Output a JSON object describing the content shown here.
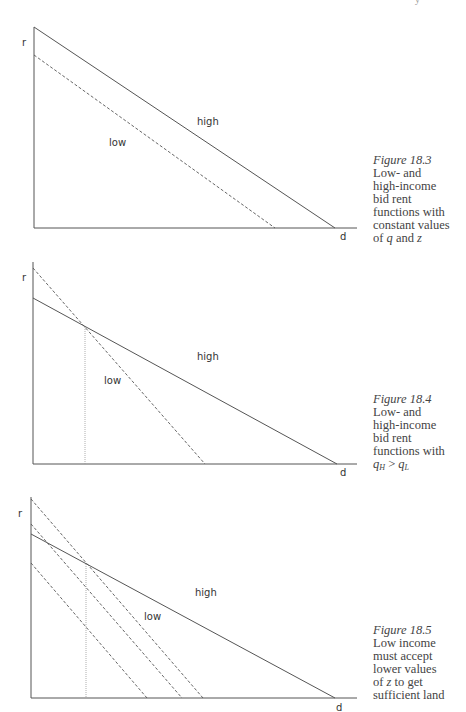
{
  "page": {
    "header_fragment": "y"
  },
  "figures": [
    {
      "id": "fig-18-3",
      "caption": {
        "title": "Figure 18.3",
        "lines": [
          "Low- and",
          "high-income",
          "bid rent",
          "functions with",
          "constant values"
        ],
        "last_line_parts": [
          "of ",
          "q",
          " and ",
          "z"
        ]
      },
      "axis_labels": {
        "y": "r",
        "x": "d"
      },
      "curve_labels": {
        "high": "high",
        "low": "low"
      }
    },
    {
      "id": "fig-18-4",
      "caption": {
        "title": "Figure 18.4",
        "lines": [
          "Low- and",
          "high-income",
          "bid rent",
          "functions with"
        ],
        "condition": {
          "left": "q",
          "left_sub": "H",
          "op": " > ",
          "right": "q",
          "right_sub": "L"
        }
      },
      "axis_labels": {
        "y": "r",
        "x": "d"
      },
      "curve_labels": {
        "high": "high",
        "low": "low"
      }
    },
    {
      "id": "fig-18-5",
      "caption": {
        "title": "Figure 18.5",
        "lines": [
          "Low income",
          "must accept",
          "lower values"
        ],
        "line_z_parts": [
          "of ",
          "z",
          " to get"
        ],
        "last_line": "sufficient land"
      },
      "axis_labels": {
        "y": "r",
        "x": "d"
      },
      "curve_labels": {
        "high": "high",
        "low": "low"
      }
    }
  ],
  "chart_data": [
    {
      "type": "line",
      "title": "Figure 18.3 Low- and high-income bid rent functions with constant values of q and z",
      "xlabel": "d",
      "ylabel": "r",
      "grid": false,
      "note": "Values in relative units: distance 0-100 (axis end), rent 0-100 (axis top)",
      "series": [
        {
          "name": "high",
          "style": "solid",
          "x": [
            0,
            93
          ],
          "y": [
            100,
            0
          ]
        },
        {
          "name": "low",
          "style": "dashed",
          "x": [
            0,
            74
          ],
          "y": [
            86,
            0
          ]
        }
      ]
    },
    {
      "type": "line",
      "title": "Figure 18.4 Low- and high-income bid rent functions with qH > qL",
      "xlabel": "d",
      "ylabel": "r",
      "grid": false,
      "note": "Low (dashed) is steeper and intersects high near d=16; dotted vertical marks the intersection",
      "series": [
        {
          "name": "high",
          "style": "solid",
          "x": [
            0,
            94
          ],
          "y": [
            81,
            0
          ]
        },
        {
          "name": "low",
          "style": "dashed",
          "x": [
            0,
            53
          ],
          "y": [
            97,
            0
          ]
        }
      ],
      "annotations": [
        {
          "type": "vline",
          "x": 16,
          "style": "dotted",
          "label": "intersection"
        }
      ]
    },
    {
      "type": "line",
      "title": "Figure 18.5 Low income must accept lower values of z to get sufficient land",
      "xlabel": "d",
      "ylabel": "r",
      "grid": false,
      "note": "Three parallel dashed low-income bid rent curves for different z values",
      "series": [
        {
          "name": "high",
          "style": "solid",
          "x": [
            0,
            93
          ],
          "y": [
            82,
            0
          ]
        },
        {
          "name": "low z1",
          "style": "dashed",
          "x": [
            0,
            53
          ],
          "y": [
            99,
            0
          ]
        },
        {
          "name": "low z2",
          "style": "dashed",
          "x": [
            0,
            46
          ],
          "y": [
            87,
            0
          ]
        },
        {
          "name": "low z3",
          "style": "dashed",
          "x": [
            0,
            36
          ],
          "y": [
            67,
            0
          ]
        }
      ],
      "annotations": [
        {
          "type": "vline",
          "x": 17,
          "style": "dotted",
          "label": "intersection"
        }
      ]
    }
  ],
  "geometry": {
    "stroke": "#555555",
    "dotted_stroke": "#9a9a9a",
    "fig1": {
      "axis": {
        "x0": 34,
        "ytop": 27,
        "ybase": 228,
        "xend": 357
      },
      "high": [
        34,
        27,
        335,
        228
      ],
      "low": [
        34,
        55,
        275,
        228
      ]
    },
    "fig2": {
      "axis": {
        "x0": 33,
        "ytop": 262,
        "ybase": 464,
        "xend": 357
      },
      "high": [
        33,
        298,
        337,
        464
      ],
      "low": [
        33,
        268,
        205,
        464
      ],
      "vline": [
        85,
        327,
        85,
        464
      ]
    },
    "fig3": {
      "axis": {
        "x0": 31,
        "ytop": 497,
        "ybase": 698,
        "xend": 357
      },
      "high": [
        31,
        534,
        335,
        698
      ],
      "lows": [
        [
          31,
          499,
          203,
          698
        ],
        [
          31,
          524,
          182,
          698
        ],
        [
          31,
          563,
          147,
          698
        ]
      ],
      "vline": [
        86,
        564,
        86,
        698
      ]
    }
  }
}
